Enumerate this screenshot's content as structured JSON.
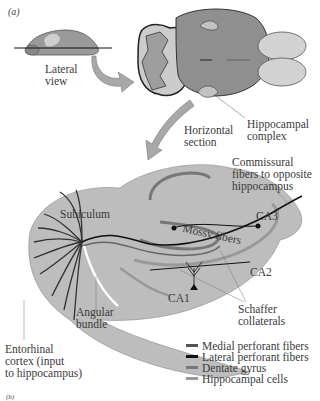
{
  "figure": {
    "panel_label": "(a)",
    "next_panel_label": "(b)"
  },
  "labels": {
    "lateral_view": "Lateral\nview",
    "horizontal_section": "Horizontal\nsection",
    "hippocampal_complex": "Hippocampal\ncomplex",
    "commissural": "Commissural\nfibers to opposite\nhippocampus",
    "subiculum": "Subiculum",
    "mossy_fibers": "Mossy fibers",
    "ca3": "CA3",
    "ca2": "CA2",
    "ca1": "CA1",
    "schaffer": "Schaffer\ncollaterals",
    "angular_bundle": "Angular\nbundle",
    "entorhinal": "Entorhinal\ncortex (input\nto hippocampus)"
  },
  "legend": {
    "items": [
      {
        "label": "Medial perforant fibers",
        "color": "#555555"
      },
      {
        "label": "Lateral perforant fibers",
        "color": "#111111"
      },
      {
        "label": "Dentate gyrus",
        "color": "#777777"
      },
      {
        "label": "Hippocampal cells",
        "color": "#999999"
      }
    ]
  },
  "colors": {
    "tissue": "#b9b9b9",
    "tissue_dark": "#8a8a8a",
    "arrow": "#a8a8a8",
    "fiber_dark": "#111111",
    "fiber_mid": "#666666"
  }
}
